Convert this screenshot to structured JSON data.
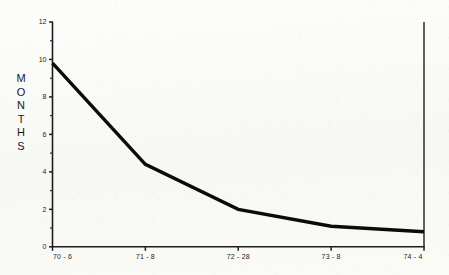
{
  "chart_data": {
    "type": "line",
    "title": "",
    "xlabel": "",
    "ylabel": "MONTHS",
    "categories": [
      "70 - 6",
      "71 - 8",
      "72 - 28",
      "73 - 8",
      "74 - 4"
    ],
    "values": [
      9.8,
      4.4,
      2.0,
      1.1,
      0.8
    ],
    "series": [
      {
        "name": "Months",
        "values": [
          9.8,
          4.4,
          2.0,
          1.1,
          0.8
        ]
      }
    ],
    "ylim": [
      0,
      12
    ],
    "ytick_labels": [
      "0",
      "2",
      "4",
      "6",
      "8",
      "10",
      "12"
    ],
    "ytick_values": [
      0,
      2,
      4,
      6,
      8,
      10,
      12
    ],
    "yminor_values": [
      1,
      3,
      5,
      7,
      9,
      11
    ],
    "grid": false,
    "legend": false,
    "legend_position": "none",
    "line_color": "#0b0b0b",
    "axis_color": "#1d1d1d",
    "background_color": "#fbfbf9"
  },
  "axis": {
    "y_title_letters": [
      "M",
      "O",
      "N",
      "T",
      "H",
      "S"
    ]
  }
}
